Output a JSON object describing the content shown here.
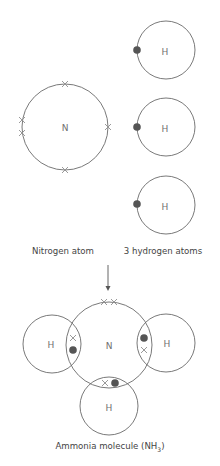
{
  "diagram": {
    "colors": {
      "shell": "#6a6a6a",
      "label": "#707070",
      "caption": "#444444",
      "nitrogen_electron_cross": "#8f8f8f",
      "hydrogen_electron_dot": "#555555",
      "arrow": "#555555"
    },
    "reactants": {
      "nitrogen_atom": {
        "symbol": "N",
        "caption": "Nitrogen atom",
        "outer_electrons": 5,
        "electron_symbol": "cross"
      },
      "hydrogen_atoms": {
        "symbol": "H",
        "caption": "3 hydrogen atoms",
        "count": 3,
        "electrons_each": 1,
        "electron_symbol": "dot"
      }
    },
    "arrow": {
      "direction": "down"
    },
    "product": {
      "center_symbol": "N",
      "bonded_symbols": [
        "H",
        "H",
        "H"
      ],
      "caption_main": "Ammonia molecule (NH",
      "caption_subscript": "3",
      "caption_end": ")",
      "shared_pairs": 3,
      "lone_pair": 1
    }
  }
}
